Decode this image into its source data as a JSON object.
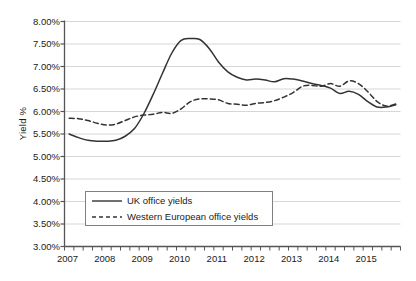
{
  "chart_data": {
    "type": "line",
    "title": "",
    "subtitle": "",
    "xlabel": "",
    "ylabel": "Yield %",
    "ylim": [
      3.0,
      8.0
    ],
    "ytick_step": 0.5,
    "ytick_labels": [
      "8.00%",
      "7.50%",
      "7.00%",
      "6.50%",
      "6.00%",
      "5.50%",
      "5.00%",
      "4.50%",
      "4.00%",
      "3.50%",
      "3.00%"
    ],
    "ytick_values": [
      8.0,
      7.5,
      7.0,
      6.5,
      6.0,
      5.5,
      5.0,
      4.5,
      4.0,
      3.5,
      3.0
    ],
    "xtick_labels": [
      "2007",
      "2008",
      "2009",
      "2010",
      "2011",
      "2012",
      "2013",
      "2014",
      "2015"
    ],
    "x_minor_ticks_per_year": 4,
    "grid": "horizontal",
    "legend_position": "inside-lower-left",
    "x": [
      "2007 Q1",
      "2007 Q2",
      "2007 Q3",
      "2007 Q4",
      "2008 Q1",
      "2008 Q2",
      "2008 Q3",
      "2008 Q4",
      "2009 Q1",
      "2009 Q2",
      "2009 Q3",
      "2009 Q4",
      "2010 Q1",
      "2010 Q2",
      "2010 Q3",
      "2010 Q4",
      "2011 Q1",
      "2011 Q2",
      "2011 Q3",
      "2011 Q4",
      "2012 Q1",
      "2012 Q2",
      "2012 Q3",
      "2012 Q4",
      "2013 Q1",
      "2013 Q2",
      "2013 Q3",
      "2013 Q4",
      "2014 Q1",
      "2014 Q2",
      "2014 Q3",
      "2014 Q4",
      "2015 Q1",
      "2015 Q2",
      "2015 Q3",
      "2015 Q4"
    ],
    "series": [
      {
        "name": "UK office yields",
        "style": "solid",
        "color": "#333333",
        "values": [
          5.5,
          5.42,
          5.36,
          5.34,
          5.34,
          5.36,
          5.45,
          5.62,
          5.95,
          6.38,
          6.85,
          7.3,
          7.58,
          7.62,
          7.6,
          7.4,
          7.1,
          6.88,
          6.76,
          6.7,
          6.72,
          6.7,
          6.66,
          6.73,
          6.72,
          6.68,
          6.62,
          6.58,
          6.52,
          6.4,
          6.45,
          6.38,
          6.22,
          6.1,
          6.1,
          6.15
        ]
      },
      {
        "name": "Western European office yields",
        "style": "dashed",
        "color": "#333333",
        "values": [
          5.85,
          5.84,
          5.8,
          5.74,
          5.7,
          5.72,
          5.8,
          5.88,
          5.92,
          5.94,
          5.98,
          5.96,
          6.06,
          6.22,
          6.28,
          6.28,
          6.26,
          6.18,
          6.16,
          6.14,
          6.18,
          6.2,
          6.24,
          6.32,
          6.42,
          6.56,
          6.58,
          6.56,
          6.62,
          6.56,
          6.68,
          6.62,
          6.44,
          6.22,
          6.12,
          6.17
        ]
      }
    ]
  },
  "legend": {
    "items": [
      {
        "label": "UK office yields",
        "style": "solid"
      },
      {
        "label": "Western European office yields",
        "style": "dashed"
      }
    ]
  },
  "axes": {
    "y_title": "Yield %"
  },
  "caption": {
    "text": ""
  }
}
